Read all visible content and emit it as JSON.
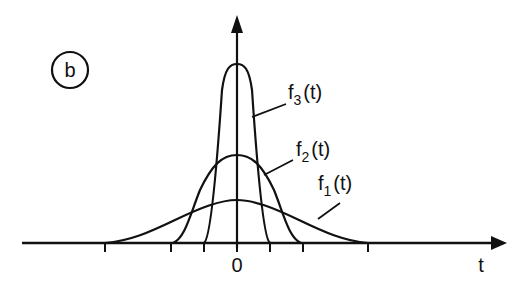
{
  "figure": {
    "panel_label": "b",
    "x_axis_label": "t",
    "origin_label": "0",
    "curves": [
      {
        "name": "f1",
        "label_main": "f",
        "label_sub": "1",
        "label_arg": "(t)",
        "description": "widest, lowest bell curve"
      },
      {
        "name": "f2",
        "label_main": "f",
        "label_sub": "2",
        "label_arg": "(t)",
        "description": "medium width and height bell curve"
      },
      {
        "name": "f3",
        "label_main": "f",
        "label_sub": "3",
        "label_arg": "(t)",
        "description": "narrowest, tallest pulse"
      }
    ],
    "tick_count": 7,
    "stroke_color": "#111111",
    "background_color": "#ffffff"
  }
}
